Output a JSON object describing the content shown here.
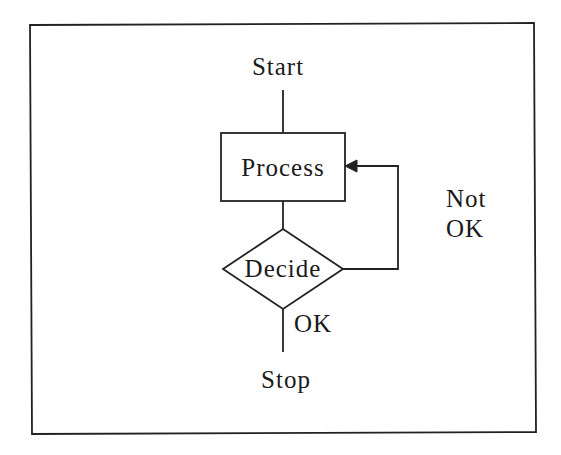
{
  "diagram": {
    "type": "flowchart",
    "colors": {
      "stroke": "#222222",
      "text": "#1a1a1a",
      "background": "#ffffff"
    },
    "nodes": {
      "start": {
        "label": "Start",
        "shape": "terminal-text"
      },
      "process": {
        "label": "Process",
        "shape": "rectangle"
      },
      "decide": {
        "label": "Decide",
        "shape": "diamond"
      },
      "stop": {
        "label": "Stop",
        "shape": "terminal-text"
      }
    },
    "edges": {
      "ok_label": "OK",
      "not_ok_label_line1": "Not",
      "not_ok_label_line2": "OK"
    },
    "connections": [
      {
        "from": "Start",
        "to": "Process"
      },
      {
        "from": "Process",
        "to": "Decide"
      },
      {
        "from": "Decide",
        "to": "Stop",
        "label": "OK"
      },
      {
        "from": "Decide",
        "to": "Process",
        "label": "Not OK",
        "arrow": true
      }
    ]
  }
}
